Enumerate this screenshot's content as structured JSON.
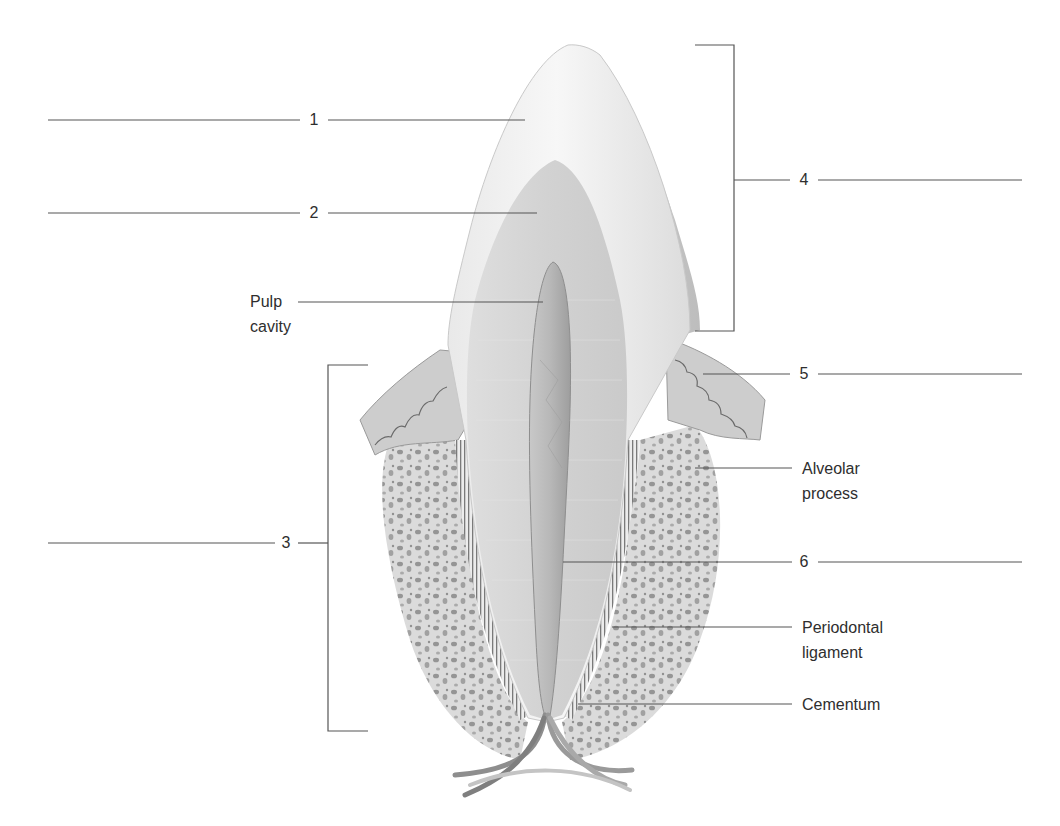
{
  "figure": {
    "numbered_blanks": [
      {
        "number": "1",
        "y": 120
      },
      {
        "number": "2",
        "y": 213
      },
      {
        "number": "3",
        "y": 543
      },
      {
        "number": "4",
        "y": 180
      },
      {
        "number": "5",
        "y": 374
      },
      {
        "number": "6",
        "y": 562
      }
    ],
    "labels": {
      "pulp_cavity": "Pulp\ncavity",
      "alveolar_process": "Alveolar\nprocess",
      "periodontal_ligament": "Periodontal\nligament",
      "cementum": "Cementum"
    },
    "colors": {
      "line": "#555555",
      "text": "#2e2e2e",
      "enamel": "#f4f4f4",
      "dentin": "#d6d6d6",
      "pulp": "#b9b9b9",
      "gum": "#cfcfcf",
      "bone": "#dcdcdc"
    }
  }
}
